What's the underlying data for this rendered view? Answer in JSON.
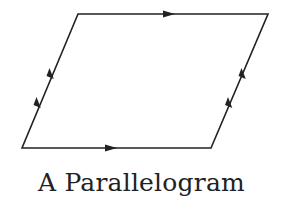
{
  "diagram": {
    "caption": "A Parallelogram",
    "stroke_color": "#222222",
    "vertices": {
      "top_left": [
        78,
        14
      ],
      "top_right": [
        268,
        14
      ],
      "bottom_right": [
        211,
        148
      ],
      "bottom_left": [
        22,
        148
      ]
    },
    "arrows": [
      {
        "side": "top",
        "count": 1,
        "direction": "right"
      },
      {
        "side": "bottom",
        "count": 1,
        "direction": "right"
      },
      {
        "side": "left",
        "count": 2,
        "direction": "up"
      },
      {
        "side": "right",
        "count": 2,
        "direction": "up"
      }
    ]
  }
}
